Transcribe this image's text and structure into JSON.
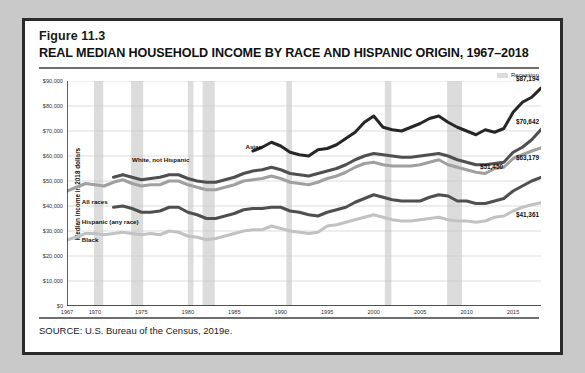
{
  "figure": {
    "number": "Figure 11.3",
    "title": "REAL MEDIAN HOUSEHOLD INCOME BY RACE AND HISPANIC ORIGIN, 1967–2018",
    "source": "SOURCE: U.S. Bureau of the Census, 2019e."
  },
  "legend": {
    "recession_label": "Recession",
    "recession_color": "#dcdcdc"
  },
  "chart_data": {
    "type": "line",
    "title": "REAL MEDIAN HOUSEHOLD INCOME BY RACE AND HISPANIC ORIGIN, 1967–2018",
    "xlabel": "",
    "ylabel": "Median income in 2018 dollars",
    "xlim": [
      1967,
      2018
    ],
    "ylim": [
      0,
      90000
    ],
    "grid": true,
    "legend_position": "inline-labels",
    "ytick_labels": [
      "$0",
      "$10,000",
      "$20,000",
      "$30,000",
      "$40,000",
      "$50,000",
      "$60,000",
      "$70,000",
      "$80,000",
      "$90,000"
    ],
    "ytick_values": [
      0,
      10000,
      20000,
      30000,
      40000,
      50000,
      60000,
      70000,
      80000,
      90000
    ],
    "xtick_labels": [
      "1967",
      "1970",
      "1975",
      "1980",
      "1985",
      "1990",
      "1995",
      "2000",
      "2005",
      "2010",
      "2015"
    ],
    "xtick_values": [
      1967,
      1970,
      1975,
      1980,
      1985,
      1990,
      1995,
      2000,
      2005,
      2010,
      2015
    ],
    "recession_bands": [
      [
        1969.9,
        1970.9
      ],
      [
        1973.9,
        1975.2
      ],
      [
        1980.0,
        1980.6
      ],
      [
        1981.6,
        1982.9
      ],
      [
        1990.6,
        1991.2
      ],
      [
        2001.2,
        2001.9
      ],
      [
        2007.9,
        2009.5
      ]
    ],
    "series": [
      {
        "name": "Asian",
        "color": "#262626",
        "width": 3.0,
        "label_x": 1986.2,
        "label_y": 63500,
        "end_label": "$87,194",
        "x": [
          1987,
          1988,
          1989,
          1990,
          1991,
          1992,
          1993,
          1994,
          1995,
          1996,
          1997,
          1998,
          1999,
          2000,
          2001,
          2002,
          2003,
          2004,
          2005,
          2006,
          2007,
          2008,
          2009,
          2010,
          2011,
          2012,
          2013,
          2014,
          2015,
          2016,
          2017,
          2018
        ],
        "values": [
          62000,
          63500,
          65500,
          64000,
          61500,
          60500,
          60000,
          62500,
          63000,
          64500,
          67000,
          69500,
          73500,
          76000,
          71500,
          70500,
          70000,
          71500,
          73000,
          75000,
          76000,
          73500,
          71500,
          70000,
          68500,
          70500,
          69500,
          71000,
          77500,
          81500,
          83500,
          87194
        ]
      },
      {
        "name": "White, not Hispanic",
        "color": "#4f4f4f",
        "width": 3.0,
        "label_x": 1974.0,
        "label_y": 58500,
        "end_label": "$70,642",
        "x": [
          1972,
          1973,
          1974,
          1975,
          1976,
          1977,
          1978,
          1979,
          1980,
          1981,
          1982,
          1983,
          1984,
          1985,
          1986,
          1987,
          1988,
          1989,
          1990,
          1991,
          1992,
          1993,
          1994,
          1995,
          1996,
          1997,
          1998,
          1999,
          2000,
          2001,
          2002,
          2003,
          2004,
          2005,
          2006,
          2007,
          2008,
          2009,
          2010,
          2011,
          2012,
          2013,
          2014,
          2015,
          2016,
          2017,
          2018
        ],
        "values": [
          51500,
          52500,
          51500,
          50500,
          51000,
          51500,
          52500,
          52500,
          51000,
          50000,
          49500,
          49500,
          50500,
          51500,
          53000,
          54000,
          54500,
          55500,
          54500,
          53000,
          52500,
          52000,
          53000,
          54000,
          55000,
          56500,
          58500,
          60000,
          61000,
          60500,
          60000,
          59500,
          59500,
          60000,
          60500,
          61000,
          60000,
          58500,
          57500,
          56500,
          56500,
          57000,
          57500,
          61500,
          63500,
          66500,
          70642
        ]
      },
      {
        "name": "All races",
        "color": "#a0a0a0",
        "width": 3.0,
        "label_x": 1968.6,
        "label_y": 41500,
        "end_label": "$63,179",
        "x": [
          1967,
          1968,
          1969,
          1970,
          1971,
          1972,
          1973,
          1974,
          1975,
          1976,
          1977,
          1978,
          1979,
          1980,
          1981,
          1982,
          1983,
          1984,
          1985,
          1986,
          1987,
          1988,
          1989,
          1990,
          1991,
          1992,
          1993,
          1994,
          1995,
          1996,
          1997,
          1998,
          1999,
          2000,
          2001,
          2002,
          2003,
          2004,
          2005,
          2006,
          2007,
          2008,
          2009,
          2010,
          2011,
          2012,
          2013,
          2014,
          2015,
          2016,
          2017,
          2018
        ],
        "values": [
          46000,
          47500,
          49000,
          48500,
          48000,
          49500,
          50500,
          49000,
          48000,
          48500,
          48500,
          50000,
          50000,
          48500,
          47500,
          46500,
          46500,
          47500,
          48500,
          50000,
          50500,
          51000,
          52000,
          51000,
          49500,
          49000,
          48500,
          49500,
          51000,
          52000,
          53500,
          55500,
          57000,
          57500,
          56500,
          56000,
          56000,
          56000,
          56500,
          57500,
          58500,
          56500,
          55500,
          54500,
          53500,
          53000,
          55000,
          55500,
          59000,
          60500,
          62000,
          63179
        ]
      },
      {
        "name": "Hispanic (any race)",
        "color": "#4f4f4f",
        "width": 3.0,
        "label_x": 1968.6,
        "label_y": 33500,
        "end_label": "$51,450",
        "x": [
          1972,
          1973,
          1974,
          1975,
          1976,
          1977,
          1978,
          1979,
          1980,
          1981,
          1982,
          1983,
          1984,
          1985,
          1986,
          1987,
          1988,
          1989,
          1990,
          1991,
          1992,
          1993,
          1994,
          1995,
          1996,
          1997,
          1998,
          1999,
          2000,
          2001,
          2002,
          2003,
          2004,
          2005,
          2006,
          2007,
          2008,
          2009,
          2010,
          2011,
          2012,
          2013,
          2014,
          2015,
          2016,
          2017,
          2018
        ],
        "values": [
          39500,
          40000,
          39000,
          37500,
          37500,
          38000,
          39500,
          39500,
          37500,
          36500,
          35000,
          35000,
          36000,
          37000,
          38500,
          39000,
          39000,
          39500,
          39500,
          38000,
          37500,
          36500,
          36000,
          37500,
          38500,
          39500,
          41500,
          43000,
          44500,
          43500,
          42500,
          42000,
          42000,
          42000,
          43500,
          44500,
          44000,
          42000,
          42000,
          41000,
          41000,
          42000,
          43000,
          46000,
          48000,
          50000,
          51450
        ]
      },
      {
        "name": "Black",
        "color": "#c2c2c2",
        "width": 3.0,
        "label_x": 1968.6,
        "label_y": 26500,
        "end_label": "$41,361",
        "x": [
          1967,
          1968,
          1969,
          1970,
          1971,
          1972,
          1973,
          1974,
          1975,
          1976,
          1977,
          1978,
          1979,
          1980,
          1981,
          1982,
          1983,
          1984,
          1985,
          1986,
          1987,
          1988,
          1989,
          1990,
          1991,
          1992,
          1993,
          1994,
          1995,
          1996,
          1997,
          1998,
          1999,
          2000,
          2001,
          2002,
          2003,
          2004,
          2005,
          2006,
          2007,
          2008,
          2009,
          2010,
          2011,
          2012,
          2013,
          2014,
          2015,
          2016,
          2017,
          2018
        ],
        "values": [
          26500,
          27500,
          29000,
          29000,
          28500,
          29000,
          29500,
          29000,
          28500,
          29000,
          28500,
          30000,
          29500,
          28000,
          27500,
          26500,
          27000,
          28000,
          29000,
          30000,
          30500,
          30500,
          32000,
          31000,
          30000,
          29500,
          29000,
          29500,
          32000,
          32500,
          33500,
          34500,
          35500,
          36500,
          35500,
          34500,
          34000,
          34000,
          34500,
          35000,
          35500,
          34500,
          34000,
          34000,
          33500,
          34000,
          35500,
          36000,
          38000,
          39500,
          40500,
          41361
        ]
      }
    ]
  }
}
